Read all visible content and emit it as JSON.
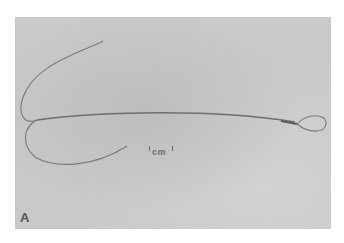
{
  "figure": {
    "panel_label": "A",
    "scale_bar": {
      "label": "cm"
    },
    "colors": {
      "background": "#c9c9c9",
      "wire": "#7a7a7a",
      "page": "#ffffff"
    }
  }
}
